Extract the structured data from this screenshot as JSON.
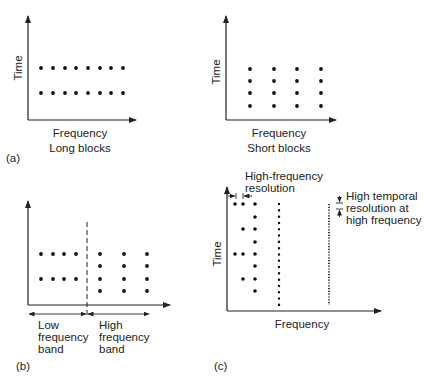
{
  "figure": {
    "panels": [
      {
        "id": "a-left",
        "label": "(a)",
        "y_axis": "Time",
        "x_axis": "Frequency",
        "caption": "Long blocks",
        "grid": {
          "columns": 8,
          "rows": 2
        }
      },
      {
        "id": "a-right",
        "y_axis": "Time",
        "x_axis": "Frequency",
        "caption": "Short blocks",
        "grid": {
          "columns": 4,
          "rows": 4
        }
      },
      {
        "id": "b",
        "label": "(b)",
        "low_band": {
          "line1": "Low",
          "line2": "frequency",
          "line3": "band",
          "grid": {
            "columns": 4,
            "rows": 2
          }
        },
        "high_band": {
          "line1": "High",
          "line2": "frequency",
          "line3": "band",
          "grid": {
            "columns": 3,
            "rows": 4
          }
        }
      },
      {
        "id": "c",
        "label": "(c)",
        "y_axis": "Time",
        "x_axis": "Frequency",
        "annotation_freq": {
          "line1": "High-frequency",
          "line2": "resolution"
        },
        "annotation_time": {
          "line1": "High temporal",
          "line2": "resolution at",
          "line3": "high frequency"
        }
      }
    ]
  }
}
